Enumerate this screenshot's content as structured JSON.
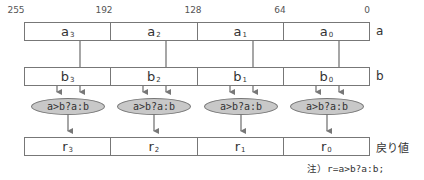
{
  "bit_labels": [
    "255",
    "192",
    "128",
    "64",
    "0"
  ],
  "rows": {
    "a": {
      "name": "a",
      "cells": [
        {
          "base": "a",
          "sub": "3"
        },
        {
          "base": "a",
          "sub": "2"
        },
        {
          "base": "a",
          "sub": "1"
        },
        {
          "base": "a",
          "sub": "0"
        }
      ]
    },
    "b": {
      "name": "b",
      "cells": [
        {
          "base": "b",
          "sub": "3"
        },
        {
          "base": "b",
          "sub": "2"
        },
        {
          "base": "b",
          "sub": "1"
        },
        {
          "base": "b",
          "sub": "0"
        }
      ]
    },
    "r": {
      "name": "戻り値",
      "cells": [
        {
          "base": "r",
          "sub": "3"
        },
        {
          "base": "r",
          "sub": "2"
        },
        {
          "base": "r",
          "sub": "1"
        },
        {
          "base": "r",
          "sub": "0"
        }
      ]
    }
  },
  "operations": [
    "a>b?a:b",
    "a>b?a:b",
    "a>b?a:b",
    "a>b?a:b"
  ],
  "note": {
    "prefix": "注）",
    "expr": "r=a>b?a:b;"
  },
  "colors": {
    "line": "#777777",
    "ellipse_fill": "#c8c8c8",
    "arrow": "#777777"
  }
}
